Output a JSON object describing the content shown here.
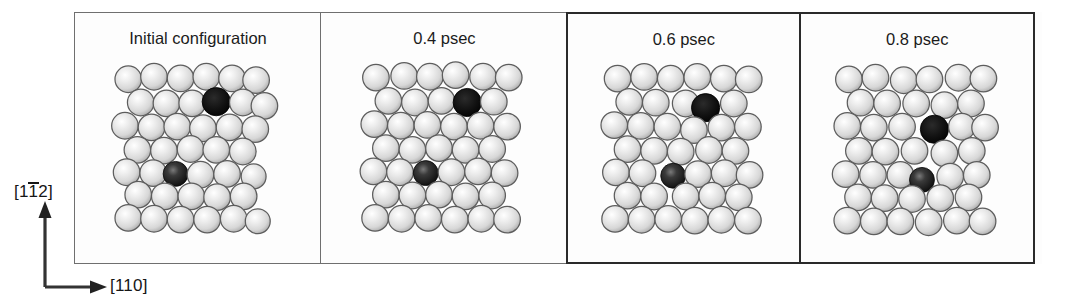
{
  "figure": {
    "kind": "molecular-dynamics-snapshot-series",
    "axes": {
      "vertical_label_prefix": "[1",
      "vertical_label_overbar": "1",
      "vertical_label_suffix": "2]",
      "vertical_label_full": "[1-12]",
      "horizontal_label": "[110]",
      "vertical_arrow": "up-arrow",
      "horizontal_arrow": "right-arrow"
    },
    "colors": {
      "atom_light": "#d7d7d7",
      "atom_light_highlight": "#ffffff",
      "atom_outline": "#5d5d5d",
      "atom_dark": "#121212",
      "atom_dark_shaded": "#1d1d1d",
      "panel_border_thin": "#6f6f6f",
      "panel_border_bold": "#2a2a2a",
      "background": "#fdfdfd",
      "text": "#1b1b1b"
    },
    "panels": [
      {
        "title": "Initial configuration",
        "border": "thin",
        "atoms": [
          {
            "x": 14,
            "y": 16,
            "r": 16,
            "type": "light"
          },
          {
            "x": 45,
            "y": 13,
            "r": 16,
            "type": "light"
          },
          {
            "x": 77,
            "y": 15,
            "r": 16,
            "type": "light"
          },
          {
            "x": 108,
            "y": 13,
            "r": 16,
            "type": "light"
          },
          {
            "x": 139,
            "y": 15,
            "r": 16,
            "type": "light"
          },
          {
            "x": 168,
            "y": 17,
            "r": 16,
            "type": "light"
          },
          {
            "x": 29,
            "y": 44,
            "r": 16,
            "type": "light"
          },
          {
            "x": 60,
            "y": 45,
            "r": 16,
            "type": "light"
          },
          {
            "x": 91,
            "y": 45,
            "r": 16,
            "type": "light"
          },
          {
            "x": 120,
            "y": 43,
            "r": 17,
            "type": "dark"
          },
          {
            "x": 152,
            "y": 44,
            "r": 16,
            "type": "light"
          },
          {
            "x": 178,
            "y": 48,
            "r": 16,
            "type": "light"
          },
          {
            "x": 10,
            "y": 72,
            "r": 16,
            "type": "light"
          },
          {
            "x": 42,
            "y": 74,
            "r": 16,
            "type": "light"
          },
          {
            "x": 73,
            "y": 73,
            "r": 16,
            "type": "light"
          },
          {
            "x": 104,
            "y": 75,
            "r": 16,
            "type": "light"
          },
          {
            "x": 136,
            "y": 74,
            "r": 16,
            "type": "light"
          },
          {
            "x": 167,
            "y": 76,
            "r": 16,
            "type": "light"
          },
          {
            "x": 25,
            "y": 101,
            "r": 16,
            "type": "light"
          },
          {
            "x": 57,
            "y": 102,
            "r": 16,
            "type": "light"
          },
          {
            "x": 89,
            "y": 100,
            "r": 16,
            "type": "light"
          },
          {
            "x": 120,
            "y": 101,
            "r": 16,
            "type": "light"
          },
          {
            "x": 152,
            "y": 103,
            "r": 16,
            "type": "light"
          },
          {
            "x": 12,
            "y": 128,
            "r": 16,
            "type": "light"
          },
          {
            "x": 44,
            "y": 129,
            "r": 16,
            "type": "light"
          },
          {
            "x": 71,
            "y": 130,
            "r": 15,
            "type": "dark-shaded"
          },
          {
            "x": 101,
            "y": 131,
            "r": 16,
            "type": "light"
          },
          {
            "x": 133,
            "y": 130,
            "r": 16,
            "type": "light"
          },
          {
            "x": 165,
            "y": 133,
            "r": 15,
            "type": "light"
          },
          {
            "x": 26,
            "y": 155,
            "r": 16,
            "type": "light"
          },
          {
            "x": 58,
            "y": 157,
            "r": 16,
            "type": "light"
          },
          {
            "x": 90,
            "y": 157,
            "r": 16,
            "type": "light"
          },
          {
            "x": 121,
            "y": 158,
            "r": 16,
            "type": "light"
          },
          {
            "x": 153,
            "y": 157,
            "r": 16,
            "type": "light"
          },
          {
            "x": 14,
            "y": 183,
            "r": 16,
            "type": "light"
          },
          {
            "x": 45,
            "y": 184,
            "r": 16,
            "type": "light"
          },
          {
            "x": 77,
            "y": 185,
            "r": 16,
            "type": "light"
          },
          {
            "x": 109,
            "y": 185,
            "r": 16,
            "type": "light"
          },
          {
            "x": 141,
            "y": 184,
            "r": 16,
            "type": "light"
          },
          {
            "x": 170,
            "y": 187,
            "r": 15,
            "type": "light"
          }
        ]
      },
      {
        "title": "0.4 psec",
        "border": "thin",
        "atoms": [
          {
            "x": 16,
            "y": 14,
            "r": 16,
            "type": "light"
          },
          {
            "x": 50,
            "y": 12,
            "r": 16,
            "type": "light"
          },
          {
            "x": 81,
            "y": 13,
            "r": 16,
            "type": "light"
          },
          {
            "x": 112,
            "y": 11,
            "r": 16,
            "type": "light"
          },
          {
            "x": 145,
            "y": 13,
            "r": 16,
            "type": "light"
          },
          {
            "x": 176,
            "y": 14,
            "r": 16,
            "type": "light"
          },
          {
            "x": 31,
            "y": 42,
            "r": 16,
            "type": "light"
          },
          {
            "x": 63,
            "y": 44,
            "r": 16,
            "type": "light"
          },
          {
            "x": 95,
            "y": 42,
            "r": 16,
            "type": "light"
          },
          {
            "x": 126,
            "y": 44,
            "r": 17,
            "type": "dark"
          },
          {
            "x": 158,
            "y": 43,
            "r": 16,
            "type": "light"
          },
          {
            "x": 14,
            "y": 70,
            "r": 16,
            "type": "light"
          },
          {
            "x": 46,
            "y": 72,
            "r": 16,
            "type": "light"
          },
          {
            "x": 78,
            "y": 71,
            "r": 16,
            "type": "light"
          },
          {
            "x": 110,
            "y": 73,
            "r": 16,
            "type": "light"
          },
          {
            "x": 142,
            "y": 72,
            "r": 16,
            "type": "light"
          },
          {
            "x": 174,
            "y": 73,
            "r": 16,
            "type": "light"
          },
          {
            "x": 28,
            "y": 99,
            "r": 16,
            "type": "light"
          },
          {
            "x": 60,
            "y": 101,
            "r": 16,
            "type": "light"
          },
          {
            "x": 92,
            "y": 99,
            "r": 16,
            "type": "light"
          },
          {
            "x": 124,
            "y": 101,
            "r": 16,
            "type": "light"
          },
          {
            "x": 156,
            "y": 100,
            "r": 16,
            "type": "light"
          },
          {
            "x": 13,
            "y": 127,
            "r": 16,
            "type": "light"
          },
          {
            "x": 45,
            "y": 128,
            "r": 16,
            "type": "light"
          },
          {
            "x": 76,
            "y": 129,
            "r": 15,
            "type": "dark-shaded"
          },
          {
            "x": 107,
            "y": 128,
            "r": 16,
            "type": "light"
          },
          {
            "x": 139,
            "y": 127,
            "r": 16,
            "type": "light"
          },
          {
            "x": 171,
            "y": 129,
            "r": 16,
            "type": "light"
          },
          {
            "x": 28,
            "y": 155,
            "r": 16,
            "type": "light"
          },
          {
            "x": 60,
            "y": 156,
            "r": 16,
            "type": "light"
          },
          {
            "x": 92,
            "y": 155,
            "r": 16,
            "type": "light"
          },
          {
            "x": 124,
            "y": 157,
            "r": 16,
            "type": "light"
          },
          {
            "x": 156,
            "y": 156,
            "r": 16,
            "type": "light"
          },
          {
            "x": 15,
            "y": 183,
            "r": 16,
            "type": "light"
          },
          {
            "x": 47,
            "y": 184,
            "r": 16,
            "type": "light"
          },
          {
            "x": 79,
            "y": 183,
            "r": 16,
            "type": "light"
          },
          {
            "x": 111,
            "y": 185,
            "r": 16,
            "type": "light"
          },
          {
            "x": 143,
            "y": 184,
            "r": 16,
            "type": "light"
          },
          {
            "x": 174,
            "y": 185,
            "r": 16,
            "type": "light"
          }
        ]
      },
      {
        "title": "0.6 psec",
        "border": "bold",
        "atoms": [
          {
            "x": 18,
            "y": 14,
            "r": 16,
            "type": "light"
          },
          {
            "x": 50,
            "y": 12,
            "r": 16,
            "type": "light"
          },
          {
            "x": 82,
            "y": 14,
            "r": 16,
            "type": "light"
          },
          {
            "x": 114,
            "y": 12,
            "r": 16,
            "type": "light"
          },
          {
            "x": 146,
            "y": 14,
            "r": 16,
            "type": "light"
          },
          {
            "x": 176,
            "y": 15,
            "r": 16,
            "type": "light"
          },
          {
            "x": 32,
            "y": 42,
            "r": 16,
            "type": "light"
          },
          {
            "x": 64,
            "y": 43,
            "r": 16,
            "type": "light"
          },
          {
            "x": 100,
            "y": 44,
            "r": 16,
            "type": "light"
          },
          {
            "x": 124,
            "y": 49,
            "r": 17,
            "type": "dark"
          },
          {
            "x": 158,
            "y": 44,
            "r": 16,
            "type": "light"
          },
          {
            "x": 14,
            "y": 70,
            "r": 16,
            "type": "light"
          },
          {
            "x": 46,
            "y": 71,
            "r": 16,
            "type": "light"
          },
          {
            "x": 78,
            "y": 72,
            "r": 16,
            "type": "light"
          },
          {
            "x": 110,
            "y": 76,
            "r": 16,
            "type": "light"
          },
          {
            "x": 143,
            "y": 73,
            "r": 16,
            "type": "light"
          },
          {
            "x": 175,
            "y": 72,
            "r": 16,
            "type": "light"
          },
          {
            "x": 30,
            "y": 99,
            "r": 16,
            "type": "light"
          },
          {
            "x": 62,
            "y": 101,
            "r": 16,
            "type": "light"
          },
          {
            "x": 94,
            "y": 102,
            "r": 16,
            "type": "light"
          },
          {
            "x": 128,
            "y": 100,
            "r": 16,
            "type": "light"
          },
          {
            "x": 160,
            "y": 101,
            "r": 16,
            "type": "light"
          },
          {
            "x": 16,
            "y": 127,
            "r": 16,
            "type": "light"
          },
          {
            "x": 48,
            "y": 128,
            "r": 16,
            "type": "light"
          },
          {
            "x": 85,
            "y": 131,
            "r": 15,
            "type": "dark-shaded"
          },
          {
            "x": 115,
            "y": 129,
            "r": 16,
            "type": "light"
          },
          {
            "x": 147,
            "y": 128,
            "r": 16,
            "type": "light"
          },
          {
            "x": 177,
            "y": 130,
            "r": 16,
            "type": "light"
          },
          {
            "x": 30,
            "y": 155,
            "r": 16,
            "type": "light"
          },
          {
            "x": 62,
            "y": 156,
            "r": 16,
            "type": "light"
          },
          {
            "x": 100,
            "y": 156,
            "r": 16,
            "type": "light"
          },
          {
            "x": 132,
            "y": 155,
            "r": 16,
            "type": "light"
          },
          {
            "x": 164,
            "y": 157,
            "r": 16,
            "type": "light"
          },
          {
            "x": 15,
            "y": 183,
            "r": 16,
            "type": "light"
          },
          {
            "x": 47,
            "y": 184,
            "r": 16,
            "type": "light"
          },
          {
            "x": 79,
            "y": 183,
            "r": 16,
            "type": "light"
          },
          {
            "x": 111,
            "y": 185,
            "r": 16,
            "type": "light"
          },
          {
            "x": 143,
            "y": 184,
            "r": 16,
            "type": "light"
          },
          {
            "x": 175,
            "y": 185,
            "r": 16,
            "type": "light"
          }
        ]
      },
      {
        "title": "0.8 psec",
        "border": "bold",
        "atoms": [
          {
            "x": 16,
            "y": 15,
            "r": 16,
            "type": "light"
          },
          {
            "x": 48,
            "y": 13,
            "r": 16,
            "type": "light"
          },
          {
            "x": 82,
            "y": 16,
            "r": 16,
            "type": "light"
          },
          {
            "x": 113,
            "y": 15,
            "r": 16,
            "type": "light"
          },
          {
            "x": 148,
            "y": 13,
            "r": 16,
            "type": "light"
          },
          {
            "x": 178,
            "y": 14,
            "r": 16,
            "type": "light"
          },
          {
            "x": 30,
            "y": 43,
            "r": 16,
            "type": "light"
          },
          {
            "x": 62,
            "y": 44,
            "r": 16,
            "type": "light"
          },
          {
            "x": 97,
            "y": 44,
            "r": 16,
            "type": "light"
          },
          {
            "x": 131,
            "y": 46,
            "r": 16,
            "type": "light"
          },
          {
            "x": 163,
            "y": 44,
            "r": 16,
            "type": "light"
          },
          {
            "x": 14,
            "y": 71,
            "r": 16,
            "type": "light"
          },
          {
            "x": 46,
            "y": 73,
            "r": 16,
            "type": "light"
          },
          {
            "x": 80,
            "y": 72,
            "r": 16,
            "type": "light"
          },
          {
            "x": 119,
            "y": 75,
            "r": 17,
            "type": "dark"
          },
          {
            "x": 152,
            "y": 72,
            "r": 16,
            "type": "light"
          },
          {
            "x": 180,
            "y": 73,
            "r": 16,
            "type": "light"
          },
          {
            "x": 28,
            "y": 101,
            "r": 16,
            "type": "light"
          },
          {
            "x": 60,
            "y": 102,
            "r": 16,
            "type": "light"
          },
          {
            "x": 95,
            "y": 101,
            "r": 16,
            "type": "light"
          },
          {
            "x": 131,
            "y": 104,
            "r": 16,
            "type": "light"
          },
          {
            "x": 164,
            "y": 101,
            "r": 16,
            "type": "light"
          },
          {
            "x": 12,
            "y": 129,
            "r": 16,
            "type": "light"
          },
          {
            "x": 45,
            "y": 130,
            "r": 16,
            "type": "light"
          },
          {
            "x": 78,
            "y": 130,
            "r": 16,
            "type": "light"
          },
          {
            "x": 104,
            "y": 136,
            "r": 15,
            "type": "dark-shaded"
          },
          {
            "x": 138,
            "y": 132,
            "r": 16,
            "type": "light"
          },
          {
            "x": 170,
            "y": 130,
            "r": 16,
            "type": "light"
          },
          {
            "x": 27,
            "y": 157,
            "r": 16,
            "type": "light"
          },
          {
            "x": 59,
            "y": 158,
            "r": 16,
            "type": "light"
          },
          {
            "x": 92,
            "y": 159,
            "r": 16,
            "type": "light"
          },
          {
            "x": 126,
            "y": 158,
            "r": 16,
            "type": "light"
          },
          {
            "x": 160,
            "y": 157,
            "r": 16,
            "type": "light"
          },
          {
            "x": 14,
            "y": 185,
            "r": 16,
            "type": "light"
          },
          {
            "x": 46,
            "y": 186,
            "r": 16,
            "type": "light"
          },
          {
            "x": 78,
            "y": 186,
            "r": 16,
            "type": "light"
          },
          {
            "x": 112,
            "y": 187,
            "r": 16,
            "type": "light"
          },
          {
            "x": 146,
            "y": 185,
            "r": 16,
            "type": "light"
          },
          {
            "x": 177,
            "y": 186,
            "r": 16,
            "type": "light"
          }
        ]
      }
    ]
  }
}
